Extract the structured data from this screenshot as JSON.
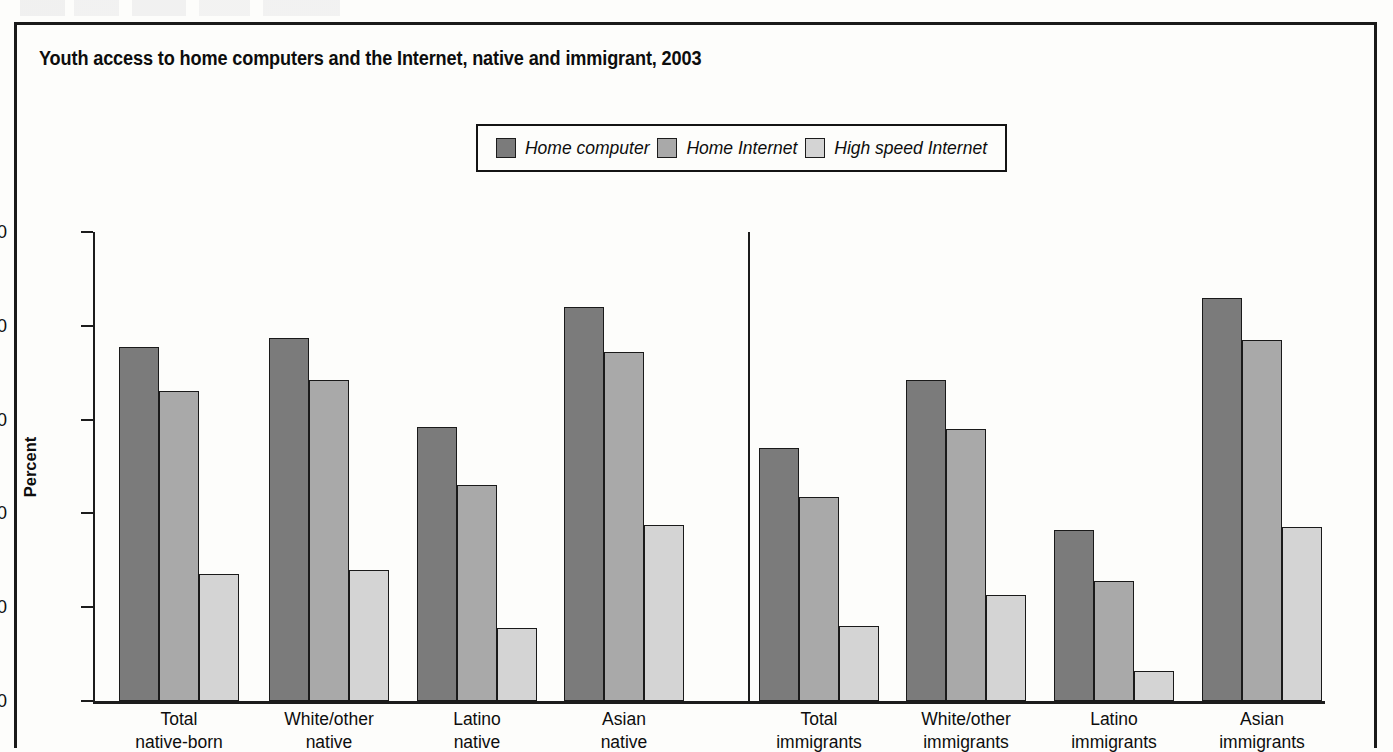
{
  "figure": {
    "title": "Youth access to home computers and the Internet, native and immigrant, 2003"
  },
  "legend": {
    "entries": [
      {
        "label": "Home computer",
        "color": "#7b7b7b",
        "icon": "legend-swatch-icon"
      },
      {
        "label": "Home Internet",
        "color": "#a9a9a9",
        "icon": "legend-swatch-icon"
      },
      {
        "label": "High speed Internet",
        "color": "#d4d4d4",
        "icon": "legend-swatch-icon"
      }
    ]
  },
  "axes": {
    "ylabel": "Percent",
    "yticks": [
      "100",
      "80",
      "60",
      "40",
      "20",
      "0"
    ]
  },
  "chart_data": {
    "type": "bar",
    "title": "Youth access to home computers and the Internet, native and immigrant, 2003",
    "xlabel": "",
    "ylabel": "Percent",
    "ylim": [
      0,
      100
    ],
    "yticks": [
      0,
      20,
      40,
      60,
      80,
      100
    ],
    "grid": false,
    "legend_position": "top-center",
    "categories": [
      "Total native-born",
      "White/other native",
      "Latino native",
      "Asian native",
      "Total immigrants",
      "White/other immigrants",
      "Latino immigrants",
      "Asian immigrants"
    ],
    "category_lines": [
      [
        "Total",
        "native-born"
      ],
      [
        "White/other",
        "native"
      ],
      [
        "Latino",
        "native"
      ],
      [
        "Asian",
        "native"
      ],
      [
        "Total",
        "immigrants"
      ],
      [
        "White/other",
        "immigrants"
      ],
      [
        "Latino",
        "immigrants"
      ],
      [
        "Asian",
        "immigrants"
      ]
    ],
    "series": [
      {
        "name": "Home computer",
        "color": "#7b7b7b",
        "values": [
          75.5,
          77.5,
          58.5,
          84.0,
          54.0,
          68.5,
          36.5,
          86.0
        ]
      },
      {
        "name": "Home Internet",
        "color": "#a9a9a9",
        "values": [
          66.0,
          68.5,
          46.0,
          74.5,
          43.5,
          58.0,
          25.5,
          77.0
        ]
      },
      {
        "name": "High speed Internet",
        "color": "#d4d4d4",
        "values": [
          27.0,
          28.0,
          15.5,
          37.5,
          16.0,
          22.5,
          6.5,
          37.0
        ]
      }
    ],
    "annotations": [
      {
        "type": "vertical-divider",
        "after_category": "Asian native",
        "note": "separates native-born groups from immigrant groups"
      }
    ]
  }
}
